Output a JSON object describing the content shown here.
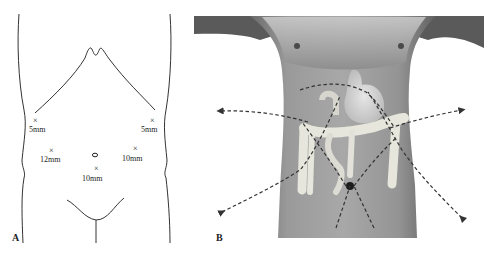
{
  "figure": {
    "panels": [
      {
        "id": "A",
        "label": "A",
        "type": "line-drawing",
        "description": "Anterior abdominal wall outline with trocar port sites",
        "ports": [
          {
            "name": "left-upper",
            "marker": "×",
            "size_label": "5mm",
            "x": 36,
            "y": 120,
            "label_x": 29,
            "label_y": 132
          },
          {
            "name": "right-upper",
            "marker": "×",
            "size_label": "5mm",
            "x": 153,
            "y": 120,
            "label_x": 142,
            "label_y": 132
          },
          {
            "name": "left-mid",
            "marker": "×",
            "size_label": "12mm",
            "x": 52,
            "y": 150,
            "label_x": 40,
            "label_y": 162
          },
          {
            "name": "right-mid",
            "marker": "×",
            "size_label": "10mm",
            "x": 136,
            "y": 148,
            "label_x": 122,
            "label_y": 161
          },
          {
            "name": "umbilical-infra",
            "marker": "×",
            "size_label": "10mm",
            "x": 97,
            "y": 168,
            "label_x": 82,
            "label_y": 180
          }
        ],
        "umbilicus": {
          "marker": "o",
          "x": 95,
          "y": 155
        }
      },
      {
        "id": "B",
        "label": "B",
        "type": "photo-illustration",
        "description": "Grayscale torso with overlaid stomach and colon; dashed arrows show instrument directions converging near umbilicus",
        "arrow_style": "dashed",
        "arrow_color": "#333333",
        "skin_tone": "#8a8a8a",
        "organ_color": "#e8e8e0"
      }
    ]
  }
}
